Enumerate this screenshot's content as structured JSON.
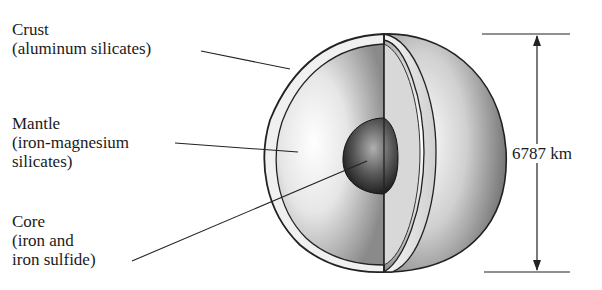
{
  "figure": {
    "layers": [
      {
        "name": "Crust",
        "composition": "(aluminum silicates)"
      },
      {
        "name": "Mantle",
        "composition_line1": "(iron-magnesium",
        "composition_line2": "silicates)"
      },
      {
        "name": "Core",
        "composition_line1": "(iron and",
        "composition_line2": "iron sulfide)"
      }
    ],
    "dimension": {
      "label": "6787 km"
    }
  }
}
